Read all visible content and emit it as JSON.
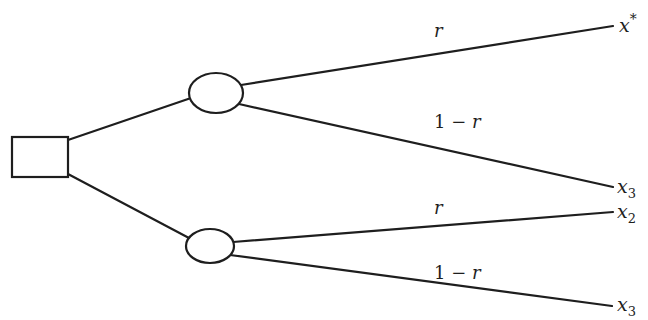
{
  "diagram": {
    "type": "decision-tree",
    "decision_node": {
      "shape": "square"
    },
    "chance_nodes": [
      {
        "id": "upper",
        "shape": "ellipse",
        "branches": [
          {
            "probability": "r",
            "outcome": "x",
            "outcome_mark": "*",
            "outcome_mark_type": "superscript"
          },
          {
            "probability_prefix": "1 − ",
            "probability": "r",
            "outcome": "x",
            "outcome_mark": "3",
            "outcome_mark_type": "subscript"
          }
        ]
      },
      {
        "id": "lower",
        "shape": "ellipse",
        "branches": [
          {
            "probability": "r",
            "outcome": "x",
            "outcome_mark": "2",
            "outcome_mark_type": "subscript"
          },
          {
            "probability_prefix": "1 − ",
            "probability": "r",
            "outcome": "x",
            "outcome_mark": "3",
            "outcome_mark_type": "subscript"
          }
        ]
      }
    ],
    "colors": {
      "line": "#1e1e1e",
      "background": "#ffffff"
    }
  }
}
